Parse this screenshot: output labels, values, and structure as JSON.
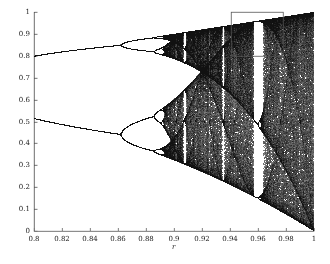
{
  "figure": {
    "background_color": "#ffffff",
    "ink_color": "#111111",
    "axis_color": "#4a4a4a",
    "width": 330,
    "height": 264
  },
  "plot_area": {
    "left": 34,
    "top": 12,
    "right": 314,
    "bottom": 231
  },
  "chart_data": {
    "type": "scatter",
    "title": "",
    "subtitle": "",
    "xlabel": "r",
    "ylabel": "",
    "xlim": [
      0.8,
      1.0
    ],
    "ylim": [
      0.0,
      1.0
    ],
    "grid": false,
    "legend": null,
    "map": {
      "equation": "x_{n+1} = 4*r*x_n*(1-x_n)",
      "r_min": 0.8,
      "r_max": 1.0,
      "x0": 0.35,
      "transient_iterations": 320,
      "plot_iterations": 260,
      "r_samples": 1200
    },
    "xticks": [
      0.8,
      0.82,
      0.84,
      0.86,
      0.88,
      0.9,
      0.92,
      0.94,
      0.96,
      0.98,
      1.0
    ],
    "xticklabels": [
      "0.8",
      "0.82",
      "0.84",
      "0.86",
      "0.88",
      "0.9",
      "0.92",
      "0.94",
      "0.96",
      "0.98",
      "1"
    ],
    "yticks": [
      0,
      0.1,
      0.2,
      0.3,
      0.4,
      0.5,
      0.6,
      0.7,
      0.8,
      0.9,
      1.0
    ],
    "yticklabels": [
      "0",
      "0.1",
      "0.2",
      "0.3",
      "0.4",
      "0.5",
      "0.6",
      "0.7",
      "0.8",
      "0.9",
      "1"
    ],
    "annotations": [
      {
        "name": "zoom-rectangle",
        "type": "rectangle",
        "x0": 0.9405,
        "x1": 0.9775,
        "y0": 0.8,
        "y1": 1.0
      }
    ],
    "features": [
      {
        "name": "fixed-point-branch",
        "r_range": [
          0.8,
          0.832
        ],
        "x_approx": [
          0.75,
          0.752
        ]
      },
      {
        "name": "first-bifurcation",
        "r": 0.832,
        "x": 0.7524
      },
      {
        "name": "period-2-upper",
        "r_range": [
          0.832,
          0.952
        ],
        "x_approx": [
          0.752,
          0.96
        ]
      },
      {
        "name": "period-2-lower",
        "r_range": [
          0.832,
          0.952
        ],
        "x_approx": [
          0.752,
          0.36
        ]
      },
      {
        "name": "second-bifurcation",
        "r": 0.952,
        "x_upper": 0.96,
        "x_lower": 0.36
      },
      {
        "name": "chaos-onset",
        "r": 0.963
      },
      {
        "name": "periodic-window",
        "r_range": [
          0.975,
          0.9765
        ]
      },
      {
        "name": "periodic-window",
        "r_range": [
          0.98,
          0.9812
        ]
      },
      {
        "name": "full-chaos-edge",
        "r": 1.0,
        "x_range": [
          0.0,
          1.0
        ]
      }
    ]
  }
}
